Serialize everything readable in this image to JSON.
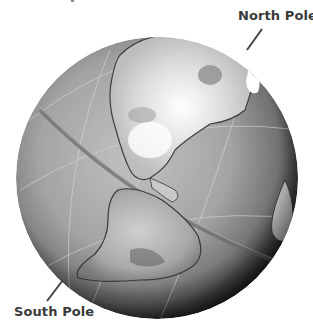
{
  "figure": {
    "labels": {
      "north": "North Pole",
      "south": "South Pole"
    },
    "colors": {
      "background": "#ffffff",
      "label_text": "#3a3a3a",
      "leader_line": "#444444",
      "ocean_light": "#b0b0b0",
      "ocean_dark": "#3a3a3a",
      "land_light": "#e8e8e8",
      "land_mid": "#9a9a9a"
    }
  }
}
